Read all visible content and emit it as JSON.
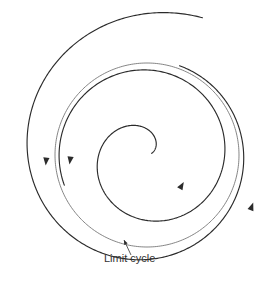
{
  "figure": {
    "background_color": "#ffffff",
    "width": 274,
    "height": 307
  },
  "annotations": {
    "limit_cycle_label": "Limit cycle",
    "label_x": 104,
    "label_y": 259,
    "leader_from": [
      131,
      255
    ],
    "leader_to": [
      124,
      240
    ]
  },
  "chart_data": {
    "type": "line",
    "title": "",
    "subtitle": "",
    "xlabel": "",
    "ylabel": "",
    "grid": false,
    "legend": null,
    "center": [
      147,
      155
    ],
    "limit_cycle_radius": 92,
    "colors": {
      "trajectory": "#2b2b2b",
      "limit_cycle": "#6f6f6f",
      "label": "#333333",
      "background": "#ffffff"
    },
    "series": [
      {
        "name": "outer trajectory (spirals inward to limit cycle)",
        "kind": "spiral",
        "direction": "counterclockwise",
        "r_start": 148,
        "r_end": 95,
        "theta_start_deg": 68,
        "theta_end_deg": 430,
        "stroke": "#2b2b2b"
      },
      {
        "name": "limit cycle",
        "kind": "circle",
        "radius": 92,
        "stroke": "#6f6f6f"
      },
      {
        "name": "inner trajectory (spirals outward to limit cycle)",
        "kind": "spiral",
        "direction": "counterclockwise",
        "r_start": 5,
        "r_end": 88,
        "theta_start_deg": 20,
        "theta_end_deg": 560,
        "stroke": "#2b2b2b"
      }
    ],
    "arrows": [
      {
        "name": "outer-left-arrow",
        "x": 46,
        "y": 162,
        "angle_deg": 95,
        "on": "outer trajectory"
      },
      {
        "name": "cycle-left-arrow",
        "x": 70,
        "y": 161,
        "angle_deg": 98,
        "on": "limit cycle"
      },
      {
        "name": "inner-arrow",
        "x": 182,
        "y": 185,
        "angle_deg": 300,
        "on": "inner trajectory"
      },
      {
        "name": "outer-right-arrow",
        "x": 252,
        "y": 206,
        "angle_deg": 290,
        "on": "outer trajectory"
      }
    ]
  }
}
